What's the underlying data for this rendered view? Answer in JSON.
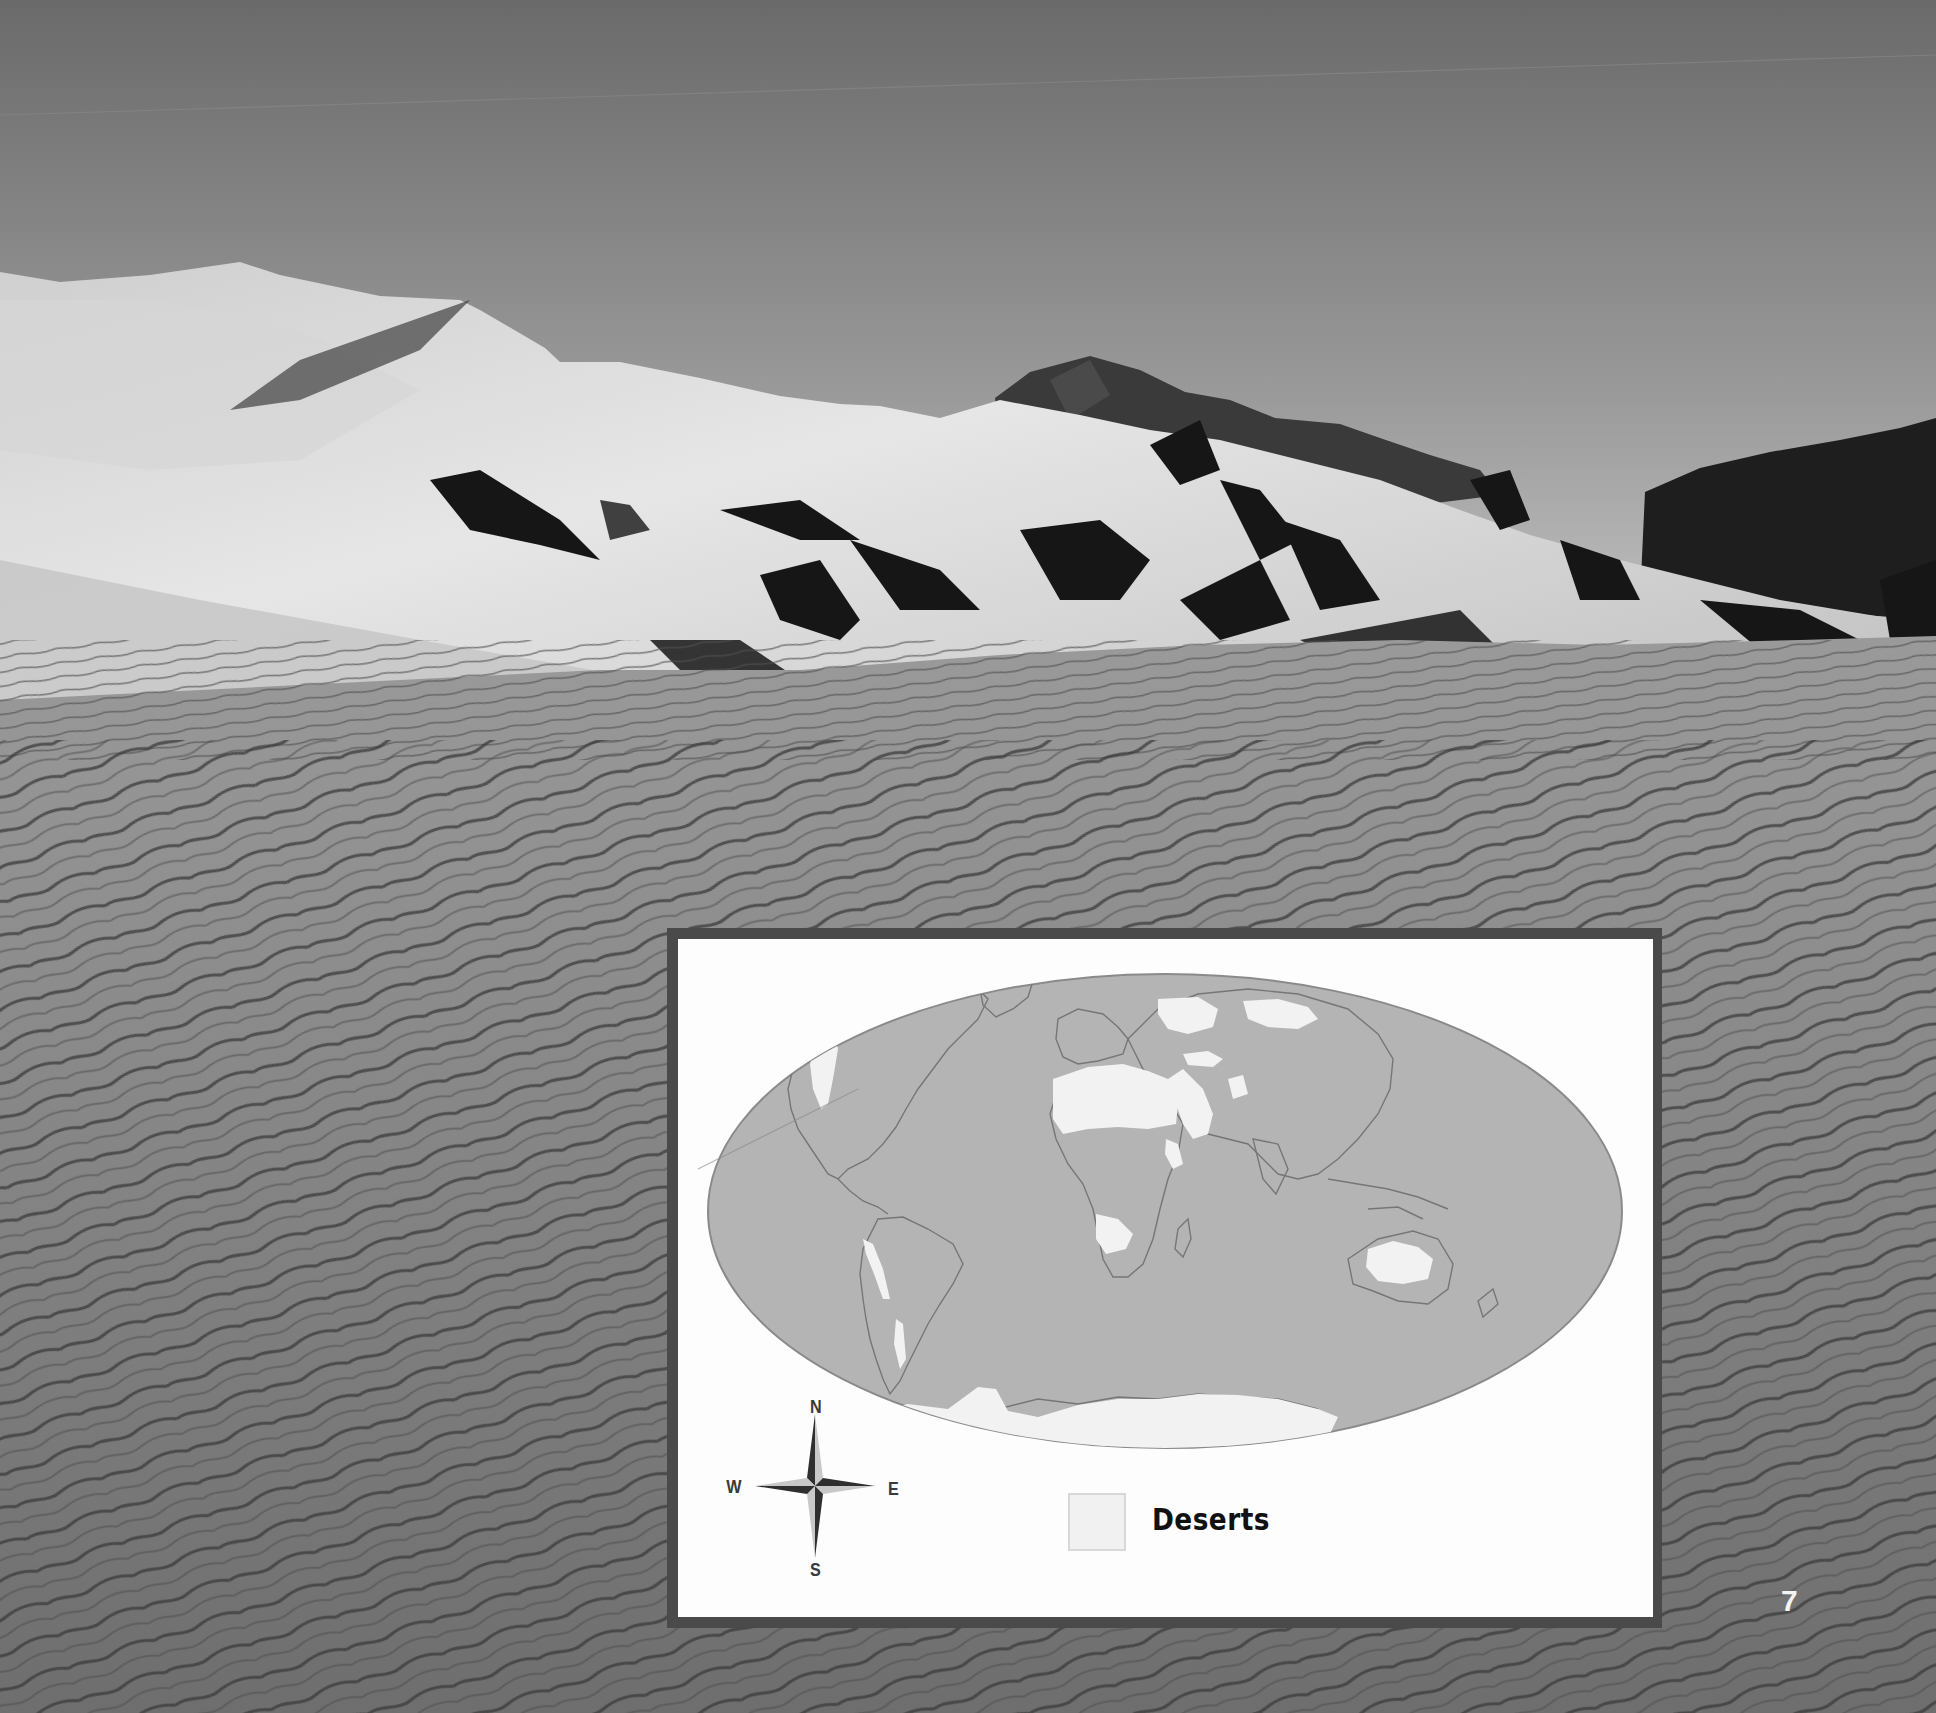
{
  "page": {
    "number": "7",
    "photo": {
      "subject": "sand dunes with rippled sand in foreground and mountains behind",
      "colors": {
        "sky_top": "#6a6a6a",
        "sky_horizon": "#c9c9c9",
        "dune_light": "#e4e4e4",
        "dune_shadow": "#1a1a1a",
        "mountain": "#2a2a2a",
        "sand_foreground": "#878787"
      }
    }
  },
  "map": {
    "frame_color": "#4a4a4a",
    "background": "#fdfdfd",
    "ocean_land_fill": "#b4b4b4",
    "coastline_color": "#777777",
    "projection": "elliptical world map",
    "regions_highlighted": [
      "North American deserts",
      "Atacama / Patagonian deserts",
      "Sahara",
      "Arabian Desert",
      "Central Asian deserts",
      "Gobi",
      "Kalahari / Namib",
      "Australian deserts",
      "Antarctica"
    ],
    "compass": {
      "north": "N",
      "south": "S",
      "east": "E",
      "west": "W"
    },
    "legend": {
      "items": [
        {
          "label": "Deserts",
          "color": "#f1f1f1"
        }
      ]
    }
  }
}
